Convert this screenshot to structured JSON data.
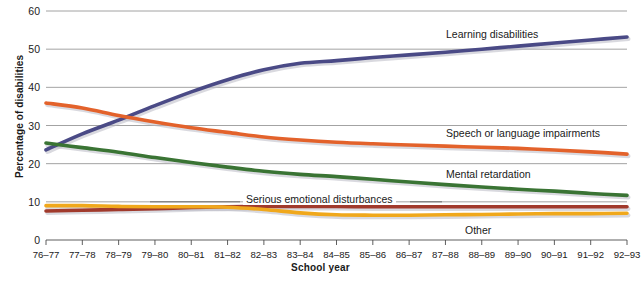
{
  "chart_data": {
    "type": "line",
    "title": "",
    "xlabel": "School year",
    "ylabel": "Percentage of disabilities",
    "ylim": [
      0,
      60
    ],
    "yticks": [
      0,
      10,
      20,
      30,
      40,
      50,
      60
    ],
    "grid": true,
    "legend_position": "inline-right",
    "categories": [
      "76–77",
      "77–78",
      "78–79",
      "79–80",
      "80–81",
      "81–82",
      "82–83",
      "83–84",
      "84–85",
      "85–86",
      "86–87",
      "87–88",
      "88–89",
      "89–90",
      "90–91",
      "91–92",
      "92–93"
    ],
    "series": [
      {
        "name": "Learning disabilities",
        "color": "#4a4a86",
        "values": [
          23.6,
          27.8,
          31.4,
          35.2,
          38.8,
          42.0,
          44.6,
          46.3,
          47.0,
          47.8,
          48.5,
          49.2,
          50.0,
          50.8,
          51.6,
          52.4,
          53.2
        ]
      },
      {
        "name": "Speech or language impairments",
        "color": "#e3622b",
        "values": [
          35.9,
          34.6,
          32.6,
          30.9,
          29.4,
          28.2,
          27.0,
          26.2,
          25.6,
          25.2,
          24.9,
          24.6,
          24.3,
          24.0,
          23.6,
          23.1,
          22.5
        ]
      },
      {
        "name": "Mental retardation",
        "color": "#3a7434",
        "values": [
          25.4,
          24.2,
          23.0,
          21.6,
          20.3,
          19.1,
          18.0,
          17.2,
          16.6,
          15.9,
          15.2,
          14.5,
          13.9,
          13.3,
          12.8,
          12.2,
          11.7
        ]
      },
      {
        "name": "Serious emotional disturbances",
        "color": "#a13a2c",
        "values": [
          7.6,
          7.8,
          8.0,
          8.2,
          8.5,
          8.7,
          8.8,
          8.8,
          8.8,
          8.7,
          8.7,
          8.7,
          8.7,
          8.7,
          8.7,
          8.7,
          8.7
        ]
      },
      {
        "name": "Other",
        "color": "#f0a81c",
        "values": [
          9.0,
          9.0,
          8.8,
          8.7,
          8.7,
          8.6,
          8.0,
          7.1,
          6.6,
          6.5,
          6.5,
          6.6,
          6.7,
          6.8,
          6.9,
          6.9,
          7.0
        ]
      }
    ],
    "annotations": [
      {
        "text": "Learning disabilities",
        "series": "Learning disabilities"
      },
      {
        "text": "Speech or language impairments",
        "series": "Speech or language impairments"
      },
      {
        "text": "Mental retardation",
        "series": "Mental retardation"
      },
      {
        "text": "Serious emotional disturbances",
        "series": "Serious emotional disturbances"
      },
      {
        "text": "Other",
        "series": "Other"
      }
    ]
  },
  "labels": {
    "learning": "Learning disabilities",
    "speech": "Speech or language impairments",
    "mental": "Mental retardation",
    "emotional": "Serious emotional disturbances",
    "other": "Other"
  },
  "axes": {
    "x_title": "School year",
    "y_title": "Percentage of disabilities"
  }
}
